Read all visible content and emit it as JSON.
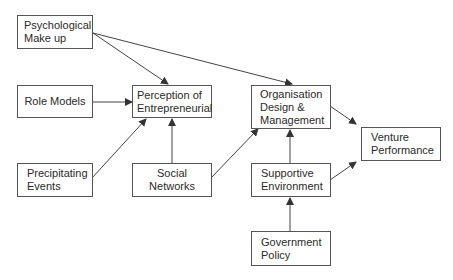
{
  "diagram": {
    "nodes": [
      {
        "id": "psych",
        "label": "Psychological Make up",
        "lines": [
          "Psychological",
          "Make up"
        ]
      },
      {
        "id": "role",
        "label": "Role Models",
        "lines": [
          "Role Models"
        ]
      },
      {
        "id": "percep",
        "label": "Perception of Entrepreneurial",
        "lines": [
          "Perception of",
          "Entrepreneurial"
        ]
      },
      {
        "id": "precip",
        "label": "Precipitating Events",
        "lines": [
          "Precipitating",
          "Events"
        ]
      },
      {
        "id": "social",
        "label": "Social Networks",
        "lines": [
          "Social Networks"
        ]
      },
      {
        "id": "org",
        "label": "Organisation Design & Management",
        "lines": [
          "Organisation",
          "Design &",
          "Management"
        ]
      },
      {
        "id": "venture",
        "label": "Venture Performance",
        "lines": [
          "Venture",
          "Performance"
        ]
      },
      {
        "id": "support",
        "label": "Supportive Environment",
        "lines": [
          "Supportive",
          "Environment"
        ]
      },
      {
        "id": "gov",
        "label": "Government Policy",
        "lines": [
          "Government",
          "Policy"
        ]
      }
    ],
    "edges": [
      {
        "from": "psych",
        "to": "percep"
      },
      {
        "from": "psych",
        "to": "org"
      },
      {
        "from": "role",
        "to": "percep"
      },
      {
        "from": "precip",
        "to": "percep"
      },
      {
        "from": "social",
        "to": "percep"
      },
      {
        "from": "social",
        "to": "org"
      },
      {
        "from": "org",
        "to": "venture"
      },
      {
        "from": "support",
        "to": "org"
      },
      {
        "from": "support",
        "to": "venture"
      },
      {
        "from": "gov",
        "to": "support"
      }
    ]
  }
}
